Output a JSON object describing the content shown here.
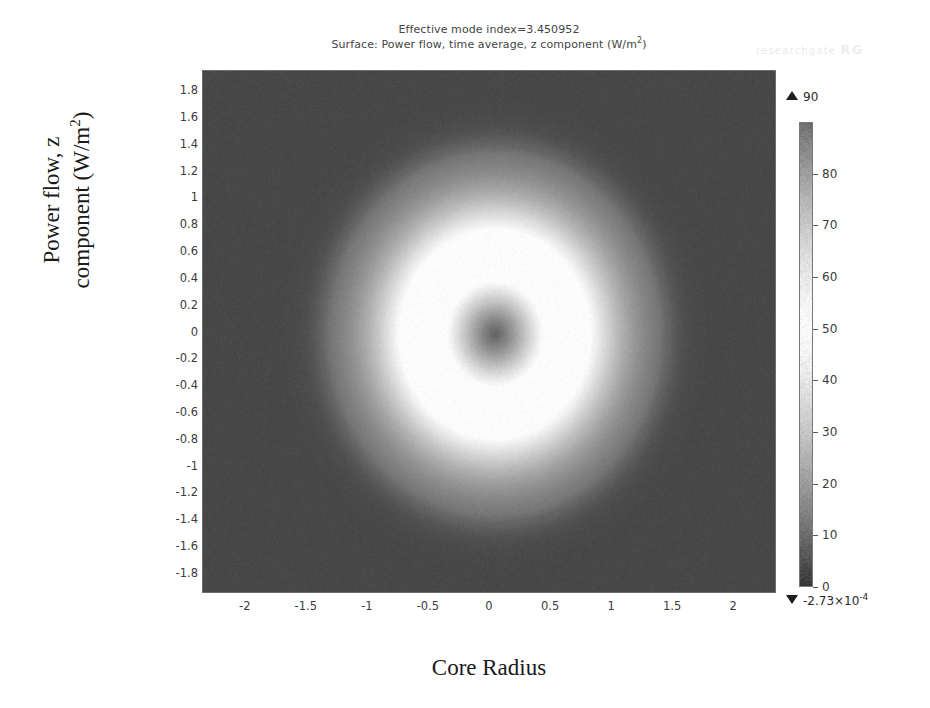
{
  "figure": {
    "title_line1": "Effective mode index=3.450952",
    "title_line2_prefix": "Surface: Power flow, time average, z component (W/m",
    "title_line2_sup": "2",
    "title_line2_suffix": ")",
    "watermark_text": "researchgate",
    "watermark_mark": "RG"
  },
  "axes": {
    "ylabel_line1": "Power flow, z",
    "ylabel_line2_prefix": "component (W/m",
    "ylabel_line2_sup": "2",
    "ylabel_line2_suffix": ")",
    "xlabel": "Core Radius"
  },
  "colorbar": {
    "max_label": "90",
    "min_label_mantissa": "-2.73×10",
    "min_label_exponent": "-4",
    "ticks": [
      "80",
      "70",
      "60",
      "50",
      "40",
      "30",
      "20",
      "10",
      "0"
    ],
    "tick_values": [
      80,
      70,
      60,
      50,
      40,
      30,
      20,
      10,
      0
    ]
  },
  "chart_data": {
    "type": "heatmap",
    "title": "Effective mode index=3.450952",
    "subtitle": "Surface: Power flow, time average, z component (W/m^2)",
    "xlabel": "Core Radius",
    "ylabel": "Power flow, z component (W/m^2)",
    "xlim": [
      -2.35,
      2.35
    ],
    "ylim": [
      -1.95,
      1.95
    ],
    "xticks": [
      -2,
      -1.5,
      -1,
      -0.5,
      0,
      0.5,
      1,
      1.5,
      2
    ],
    "xticklabels": [
      "-2",
      "-1.5",
      "-1",
      "-0.5",
      "0",
      "0.5",
      "1",
      "1.5",
      "2"
    ],
    "yticks": [
      1.8,
      1.6,
      1.4,
      1.2,
      1,
      0.8,
      0.6,
      0.4,
      0.2,
      0,
      -0.2,
      -0.4,
      -0.6,
      -0.8,
      -1,
      -1.2,
      -1.4,
      -1.6,
      -1.8
    ],
    "yticklabels": [
      "1.8",
      "1.6",
      "1.4",
      "1.2",
      "1",
      "0.8",
      "0.6",
      "0.4",
      "0.2",
      "0",
      "-0.2",
      "-0.4",
      "-0.6",
      "-0.8",
      "-1",
      "-1.2",
      "-1.4",
      "-1.6",
      "-1.8"
    ],
    "grid": false,
    "legend": "none",
    "colormap": "grayscale",
    "zmin": -0.000273,
    "zmax": 90,
    "colorbar_ticks": [
      0,
      10,
      20,
      30,
      40,
      50,
      60,
      70,
      80
    ],
    "field": {
      "description": "Annular (donut) guided mode: dark background, bright ring peaking near r=0.55, dark node at centre, faint circular core boundary at r=1.4",
      "center": [
        0.05,
        -0.02
      ],
      "peak_value": 90,
      "background_value": 3,
      "ring_peak_radius": 0.55,
      "ring_sigma": 0.3,
      "inner_node_radius": 0.0,
      "inner_node_value": 12,
      "core_boundary_radius": 1.4,
      "halo_outer_radius": 1.25,
      "halo_value": 22,
      "noise_amplitude": 0.035
    }
  }
}
